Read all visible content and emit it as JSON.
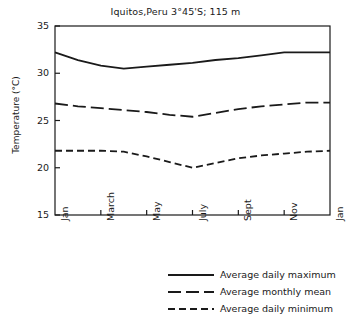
{
  "chart_data": {
    "type": "line",
    "title": "Iquitos,Peru  3°45'S; 115 m",
    "xlabel": "",
    "ylabel": "Temperature (°C)",
    "ylim": [
      15,
      35
    ],
    "yticks": [
      15,
      20,
      25,
      30,
      35
    ],
    "xticks": [
      "Jan",
      "March",
      "May",
      "July",
      "Sept",
      "Nov",
      "Jan"
    ],
    "x": [
      "Jan",
      "Feb",
      "March",
      "April",
      "May",
      "June",
      "July",
      "Aug",
      "Sept",
      "Oct",
      "Nov",
      "Dec",
      "Jan"
    ],
    "grid": false,
    "legend_position": "bottom-right",
    "series": [
      {
        "name": "Average daily maximum",
        "style": "solid",
        "color": "#1a1a1a",
        "values": [
          32.2,
          31.4,
          30.8,
          30.5,
          30.7,
          30.9,
          31.1,
          31.4,
          31.6,
          31.9,
          32.2,
          32.2,
          32.2
        ]
      },
      {
        "name": "Average monthly mean",
        "style": "long-dash",
        "color": "#1a1a1a",
        "values": [
          26.8,
          26.5,
          26.3,
          26.1,
          25.9,
          25.6,
          25.4,
          25.8,
          26.2,
          26.5,
          26.7,
          26.9,
          26.9
        ]
      },
      {
        "name": "Average daily minimum",
        "style": "short-dash",
        "color": "#1a1a1a",
        "values": [
          21.8,
          21.8,
          21.8,
          21.7,
          21.2,
          20.6,
          20.0,
          20.5,
          21.0,
          21.3,
          21.5,
          21.7,
          21.8
        ]
      }
    ]
  },
  "legend": {
    "items": [
      {
        "label": "Average daily maximum",
        "style": "solid"
      },
      {
        "label": "Average monthly mean",
        "style": "long-dash"
      },
      {
        "label": "Average daily minimum",
        "style": "short-dash"
      }
    ]
  }
}
